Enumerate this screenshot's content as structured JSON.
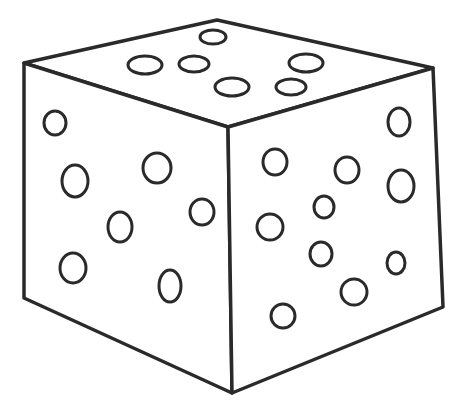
{
  "image": {
    "subject": "die-line-drawing",
    "stroke_color": "#2a2a2a",
    "fill_color": "#ffffff",
    "background": "#ffffff"
  },
  "cube": {
    "top_face": [
      [
        217,
        20
      ],
      [
        433,
        68
      ],
      [
        228,
        127
      ],
      [
        24,
        63
      ]
    ],
    "left_face": [
      [
        24,
        63
      ],
      [
        228,
        127
      ],
      [
        232,
        393
      ],
      [
        24,
        298
      ]
    ],
    "right_face": [
      [
        228,
        127
      ],
      [
        433,
        68
      ],
      [
        443,
        307
      ],
      [
        232,
        393
      ]
    ]
  },
  "spots": {
    "top": [
      {
        "cx": 213,
        "cy": 37,
        "rx": 13,
        "ry": 7
      },
      {
        "cx": 145,
        "cy": 65,
        "rx": 17,
        "ry": 9
      },
      {
        "cx": 194,
        "cy": 64,
        "rx": 15,
        "ry": 8
      },
      {
        "cx": 306,
        "cy": 63,
        "rx": 17,
        "ry": 9
      },
      {
        "cx": 232,
        "cy": 87,
        "rx": 17,
        "ry": 9
      },
      {
        "cx": 291,
        "cy": 87,
        "rx": 15,
        "ry": 8
      }
    ],
    "left": [
      {
        "cx": 55,
        "cy": 123,
        "rx": 11,
        "ry": 12
      },
      {
        "cx": 75,
        "cy": 181,
        "rx": 13,
        "ry": 16
      },
      {
        "cx": 157,
        "cy": 168,
        "rx": 14,
        "ry": 15
      },
      {
        "cx": 120,
        "cy": 227,
        "rx": 12,
        "ry": 15
      },
      {
        "cx": 202,
        "cy": 212,
        "rx": 12,
        "ry": 13
      },
      {
        "cx": 73,
        "cy": 268,
        "rx": 13,
        "ry": 15
      },
      {
        "cx": 170,
        "cy": 286,
        "rx": 11,
        "ry": 16
      }
    ],
    "right": [
      {
        "cx": 399,
        "cy": 122,
        "rx": 11,
        "ry": 14
      },
      {
        "cx": 275,
        "cy": 162,
        "rx": 12,
        "ry": 13
      },
      {
        "cx": 347,
        "cy": 170,
        "rx": 12,
        "ry": 13
      },
      {
        "cx": 401,
        "cy": 186,
        "rx": 13,
        "ry": 16
      },
      {
        "cx": 324,
        "cy": 207,
        "rx": 10,
        "ry": 11
      },
      {
        "cx": 270,
        "cy": 227,
        "rx": 13,
        "ry": 13
      },
      {
        "cx": 321,
        "cy": 254,
        "rx": 11,
        "ry": 12
      },
      {
        "cx": 396,
        "cy": 263,
        "rx": 9,
        "ry": 11
      },
      {
        "cx": 354,
        "cy": 292,
        "rx": 13,
        "ry": 13
      },
      {
        "cx": 283,
        "cy": 316,
        "rx": 12,
        "ry": 12
      }
    ]
  }
}
